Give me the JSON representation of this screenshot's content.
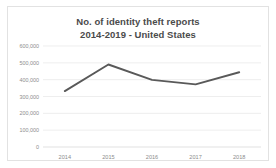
{
  "chart_data": {
    "type": "line",
    "title": "No. of identity theft reports",
    "subtitle": "2014-2019 - United States",
    "title_lines": [
      "No. of identity theft reports",
      "2014-2019 - United States"
    ],
    "categories": [
      "2014",
      "2015",
      "2016",
      "2017",
      "2018"
    ],
    "values": [
      332000,
      490000,
      399000,
      372000,
      444000
    ],
    "series": [
      {
        "name": "No. of identity theft reports",
        "values": [
          332000,
          490000,
          399000,
          372000,
          444000
        ],
        "color": "#595959"
      }
    ],
    "xlabel": "",
    "ylabel": "",
    "ylim": [
      0,
      600000
    ],
    "ytick_values": [
      600000,
      500000,
      400000,
      300000,
      200000,
      100000,
      0
    ],
    "ytick_labels": [
      "600,000",
      "500,000",
      "400,000",
      "300,000",
      "200,000",
      "100,000",
      "0"
    ],
    "xtick_labels": [
      "2014",
      "2015",
      "2016",
      "2017",
      "2018"
    ],
    "grid": true,
    "grid_axis": "y",
    "legend": false,
    "legend_position": "none",
    "colors": {
      "line": "#595959",
      "grid": "#e6e6e6",
      "axis": "#d9d9d9",
      "title_text": "#4b4b4b",
      "tick_text": "#8c8c8c",
      "background": "#ffffff",
      "border": "#e2e2e2"
    }
  }
}
